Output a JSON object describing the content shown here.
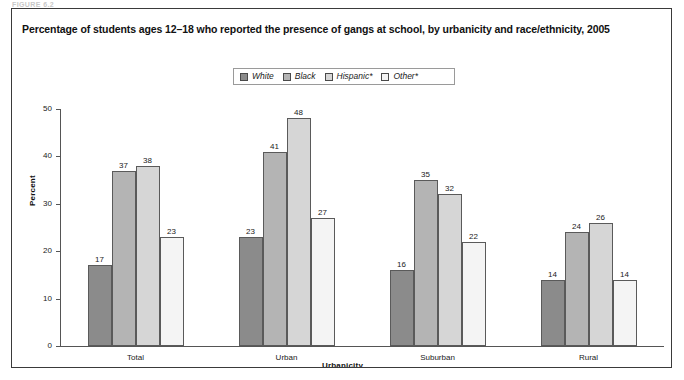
{
  "figure_label": "FIGURE 6.2",
  "title": "Percentage of students ages 12–18 who reported the presence of gangs at school, by urbanicity and race/ethnicity, 2005",
  "legend": {
    "items": [
      {
        "label": "White",
        "color": "#8b8b8b"
      },
      {
        "label": "Black",
        "color": "#b4b4b4"
      },
      {
        "label": "Hispanic*",
        "color": "#d6d6d6"
      },
      {
        "label": "Other*",
        "color": "#f4f4f4"
      }
    ]
  },
  "chart_data": {
    "type": "bar",
    "title": "Percentage of students ages 12–18 who reported the presence of gangs at school, by urbanicity and race/ethnicity, 2005",
    "xlabel": "Urbanicity",
    "ylabel": "Percent",
    "ylim": [
      0,
      50
    ],
    "yticks": [
      0,
      10,
      20,
      30,
      40,
      50
    ],
    "ytick_labels": [
      "0",
      "10",
      "20",
      "30",
      "40",
      "50"
    ],
    "grid": false,
    "legend_position": "top-center",
    "categories": [
      "Total",
      "Urban",
      "Suburban",
      "Rural"
    ],
    "series": [
      {
        "name": "White",
        "color": "#8b8b8b",
        "values": [
          17,
          23,
          16,
          14
        ]
      },
      {
        "name": "Black",
        "color": "#b4b4b4",
        "values": [
          37,
          41,
          35,
          24
        ]
      },
      {
        "name": "Hispanic*",
        "color": "#d6d6d6",
        "values": [
          38,
          48,
          32,
          26
        ]
      },
      {
        "name": "Other*",
        "color": "#f4f4f4",
        "values": [
          23,
          27,
          22,
          14
        ]
      }
    ],
    "data_labels": [
      [
        "17",
        "37",
        "38",
        "23"
      ],
      [
        "23",
        "41",
        "48",
        "27"
      ],
      [
        "16",
        "35",
        "32",
        "22"
      ],
      [
        "14",
        "24",
        "26",
        "14"
      ]
    ]
  }
}
